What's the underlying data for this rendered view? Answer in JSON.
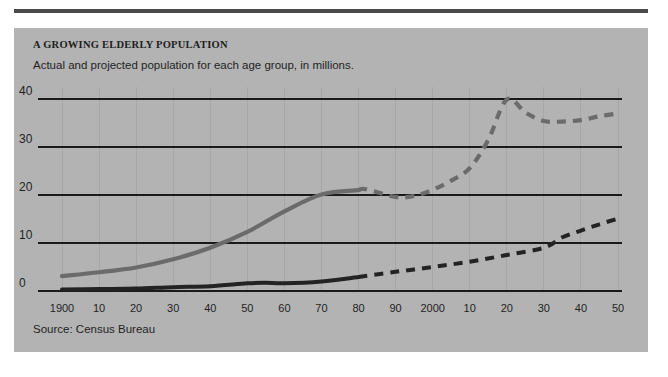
{
  "figure": {
    "title": "A GROWING ELDERLY POPULATION",
    "subtitle": "Actual and projected population for each age group, in millions.",
    "source": "Source: Census Bureau",
    "panel_color": "#b3b3b3",
    "rule_color": "#4a4a4a"
  },
  "chart_data": {
    "type": "line",
    "title": "A GROWING ELDERLY POPULATION",
    "subtitle": "Actual and projected population for each age group, in millions.",
    "xlabel": "",
    "ylabel": "",
    "note": "Source: Census Bureau",
    "grid": "horizontal gridlines at each y tick; faint vertical gridlines at each decade",
    "legend": "none",
    "ylim": [
      0,
      42
    ],
    "yticks": [
      0,
      10,
      20,
      30,
      40
    ],
    "ytick_labels": [
      "0",
      "10",
      "20",
      "30",
      "40"
    ],
    "xlim": [
      1900,
      2050
    ],
    "xticks": [
      1900,
      1910,
      1920,
      1930,
      1940,
      1950,
      1960,
      1970,
      1980,
      1990,
      2000,
      2010,
      2020,
      2030,
      2040,
      2050
    ],
    "xtick_labels": [
      "1900",
      "10",
      "20",
      "30",
      "40",
      "50",
      "60",
      "70",
      "80",
      "90",
      "2000",
      "10",
      "20",
      "30",
      "40",
      "50"
    ],
    "projection_starts": 1980,
    "series": [
      {
        "name": "older elderly age group (upper line)",
        "color": "#6b6b6b",
        "style": "solid until 1980, dashed after (projection)",
        "x": [
          1900,
          1910,
          1920,
          1930,
          1940,
          1950,
          1960,
          1970,
          1980,
          1982,
          1990,
          1995,
          2000,
          2005,
          2010,
          2015,
          2020,
          2025,
          2030,
          2035,
          2040,
          2045,
          2050
        ],
        "values": [
          3.1,
          3.9,
          4.9,
          6.6,
          9.0,
          12.3,
          16.6,
          20.1,
          21.0,
          21.2,
          19.6,
          19.8,
          21.1,
          23.0,
          25.6,
          31.5,
          39.9,
          37.2,
          35.4,
          35.3,
          35.6,
          36.4,
          37.0
        ]
      },
      {
        "name": "oldest elderly age group (lower line)",
        "color": "#232323",
        "style": "solid until 1980, dashed after (projection)",
        "x": [
          1900,
          1910,
          1920,
          1930,
          1940,
          1950,
          1955,
          1960,
          1970,
          1980,
          1990,
          2000,
          2010,
          2020,
          2030,
          2035,
          2040,
          2045,
          2050
        ],
        "values": [
          0.3,
          0.4,
          0.5,
          0.8,
          1.0,
          1.6,
          1.7,
          1.6,
          2.0,
          2.9,
          4.0,
          5.0,
          6.1,
          7.5,
          9.0,
          11.2,
          12.6,
          13.9,
          15.1
        ]
      }
    ]
  },
  "axes_geometry": {
    "plot_left_px": 48,
    "plot_right_px": 604,
    "y0_px": 263,
    "y40_px": 71,
    "panel_width_px": 634,
    "panel_height_px": 324
  }
}
